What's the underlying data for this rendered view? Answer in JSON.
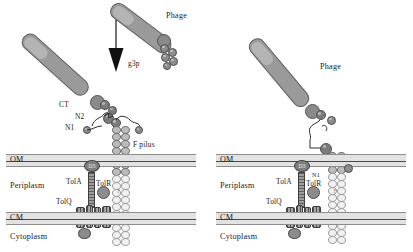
{
  "figure": {
    "type": "schematic-diagram",
    "panel_count": 2
  },
  "colors": {
    "membrane_fill": "#e2e2e2",
    "membrane_line": "#4a4a4a",
    "phage_body": "#9a9a9a",
    "protein_blob": "#8c8c8c",
    "pilus_upper": "#bdbdbd",
    "pilus_lower": "#f1f1f1",
    "arrow": "#000000"
  },
  "panels": [
    {
      "id": "left",
      "name": "initial-binding-panel",
      "labels": {
        "phage": "Phage",
        "g3p": "g3p",
        "ct": "CT",
        "n2": "N2",
        "n1": "N1",
        "f_pilus": "F pilus",
        "om": "OM",
        "periplasm": "Periplasm",
        "cm": "CM",
        "cytoplasm": "Cytoplasm",
        "tola": "TolA",
        "tolr": "TolR",
        "tolq": "TolQ",
        "d3": "D3",
        "unknown": "?"
      },
      "arrow": {
        "name": "downward-arrow",
        "direction": "down"
      }
    },
    {
      "id": "right",
      "name": "translocation-panel",
      "labels": {
        "phage": "Phage",
        "n1": "N1",
        "f_pilus": "",
        "om": "OM",
        "periplasm": "Periplasm",
        "cm": "CM",
        "cytoplasm": "Cytoplasm",
        "tola": "TolA",
        "tolr": "TolR",
        "tolq": "TolQ",
        "d3": "D3",
        "unknown": "?"
      }
    }
  ]
}
